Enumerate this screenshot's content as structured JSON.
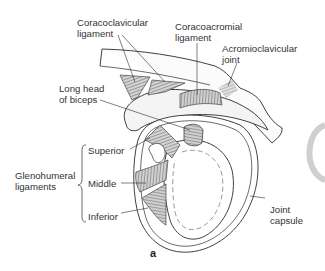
{
  "figure": {
    "panel_label": "a",
    "labels": {
      "coracoclavicular": [
        "Coracoclavicular",
        "ligament"
      ],
      "coracoacromial": [
        "Coracoacromial",
        "ligament"
      ],
      "acromioclavicular": [
        "Acromioclavicular",
        "joint"
      ],
      "long_head_biceps": [
        "Long head",
        "of biceps"
      ],
      "glenohumeral": [
        "Glenohumeral",
        "ligaments"
      ],
      "superior": "Superior",
      "middle": "Middle",
      "inferior": "Inferior",
      "joint_capsule": [
        "Joint",
        "capsule"
      ]
    }
  },
  "colors": {
    "line": "#2b2b2b",
    "hatch": "#555555",
    "shade": "#d0d0d0",
    "edge_artifact": "#cfcfcf"
  }
}
